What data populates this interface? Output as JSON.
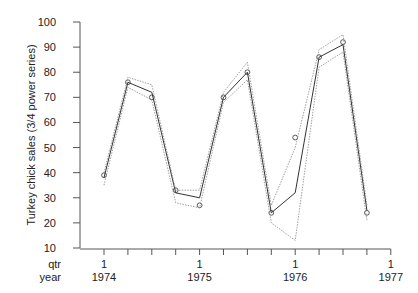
{
  "chart_data": {
    "type": "line",
    "title": "",
    "ylabel": "Turkey chick sales (3/4 power series)",
    "xlabel_rows": [
      "qtr",
      "year"
    ],
    "ylim": [
      10,
      100
    ],
    "yticks": [
      10,
      20,
      30,
      40,
      50,
      60,
      70,
      80,
      90,
      100
    ],
    "x_major_ticks": [
      {
        "qtr": "1",
        "year": "1974",
        "index": 0
      },
      {
        "qtr": "1",
        "year": "1975",
        "index": 4
      },
      {
        "qtr": "1",
        "year": "1976",
        "index": 8
      },
      {
        "qtr": "1",
        "year": "1977",
        "index": 12
      }
    ],
    "x_minor_tick_count": 13,
    "grid": false,
    "legend": "none",
    "x": [
      "1974Q1",
      "1974Q2",
      "1974Q3",
      "1974Q4",
      "1975Q1",
      "1975Q2",
      "1975Q3",
      "1975Q4",
      "1976Q1",
      "1976Q2",
      "1976Q3",
      "1976Q4"
    ],
    "series": [
      {
        "name": "observed",
        "style": "circles",
        "values": [
          39,
          76,
          70,
          33,
          27,
          70,
          80,
          24,
          54,
          86,
          92,
          24
        ]
      },
      {
        "name": "fitted",
        "style": "solid",
        "values": [
          38,
          76,
          72,
          32,
          30,
          70,
          80,
          24,
          32,
          86,
          91,
          25
        ]
      },
      {
        "name": "upper band",
        "style": "dotted",
        "values": [
          40,
          78,
          75,
          33,
          33,
          72,
          84,
          27,
          50,
          89,
          95,
          27
        ]
      },
      {
        "name": "lower band",
        "style": "dotted",
        "values": [
          35,
          74,
          69,
          28,
          26,
          68,
          77,
          20,
          13,
          82,
          88,
          21
        ]
      }
    ]
  }
}
